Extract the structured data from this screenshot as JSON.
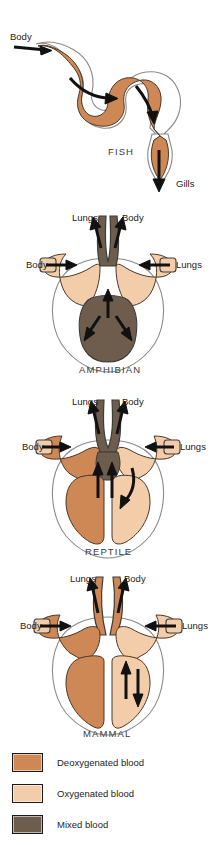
{
  "figure": {
    "colors": {
      "deoxygenated": "#CE8855",
      "oxygenated": "#F3CDA9",
      "mixed": "#6E5C4C",
      "outline": "#8a8a8a",
      "vessel_outline": "#3c3c3c",
      "arrow": "#111111",
      "label_text": "#3a3a3a"
    },
    "panels": [
      {
        "id": "fish",
        "class_label": "FISH",
        "inflow_label": "Body",
        "outflow_label": "Gills",
        "blood_type": "deoxygenated",
        "chambers": "single circuit: sinus venosus, atrium, ventricle, conus arteriosus"
      },
      {
        "id": "amphibian",
        "class_label": "AMPHIBIAN",
        "top_left_label": "Lungs",
        "top_right_label": "Body",
        "left_label": "Body",
        "right_label": "Lungs",
        "blood_types": [
          "oxygenated",
          "mixed"
        ],
        "chambers": "two atria, one ventricle"
      },
      {
        "id": "reptile",
        "class_label": "REPTILE",
        "top_left_label": "Lungs",
        "top_right_label": "Body",
        "left_label": "Body",
        "right_label": "Lungs",
        "blood_types": [
          "deoxygenated",
          "oxygenated",
          "mixed"
        ],
        "chambers": "two atria, partially divided ventricle"
      },
      {
        "id": "mammal",
        "class_label": "MAMMAL",
        "top_left_label": "Lungs",
        "top_right_label": "Body",
        "left_label": "Body",
        "right_label": "Lungs",
        "blood_types": [
          "deoxygenated",
          "oxygenated"
        ],
        "chambers": "two atria, two fully separated ventricles"
      }
    ]
  },
  "legend": {
    "items": [
      {
        "label": "Deoxygenated blood",
        "color": "#CE8855"
      },
      {
        "label": "Oxygenated blood",
        "color": "#F3CDA9"
      },
      {
        "label": "Mixed blood",
        "color": "#6E5C4C"
      }
    ]
  }
}
